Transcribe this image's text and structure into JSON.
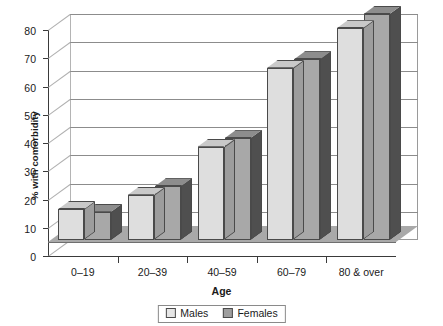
{
  "chart_data": {
    "type": "bar",
    "title": "",
    "xlabel": "Age",
    "ylabel": "% with comorbidity",
    "categories": [
      "0–19",
      "20–39",
      "40–59",
      "60–79",
      "80 & over"
    ],
    "series": [
      {
        "name": "Males",
        "values": [
          11,
          16,
          33,
          61,
          75
        ],
        "color": "#dedede"
      },
      {
        "name": "Females",
        "values": [
          10,
          19,
          36,
          64,
          80
        ],
        "color": "#a8a8a8"
      }
    ],
    "ylim": [
      0,
      80
    ],
    "yticks": [
      0,
      10,
      20,
      30,
      40,
      50,
      60,
      70,
      80
    ],
    "ytick_labels": [
      "0",
      "10",
      "20",
      "30",
      "40",
      "50",
      "60",
      "70",
      "80"
    ],
    "grid": true,
    "legend_position": "bottom",
    "style": "3d-grouped-column"
  },
  "legend": {
    "items": [
      {
        "label": "Males"
      },
      {
        "label": "Females"
      }
    ]
  },
  "axes": {
    "y_title": "% with comorbidity",
    "x_title": "Age"
  }
}
